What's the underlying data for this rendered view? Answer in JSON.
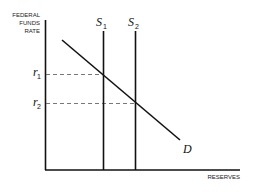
{
  "diagram": {
    "y_axis_label": [
      "FEDERAL",
      "FUNDS",
      "RATE"
    ],
    "x_axis_label": "RESERVES",
    "supply_1": {
      "symbol": "S",
      "subscript": "1"
    },
    "supply_2": {
      "symbol": "S",
      "subscript": "2"
    },
    "demand": {
      "symbol": "D"
    },
    "rate_1": {
      "symbol": "r",
      "subscript": "1"
    },
    "rate_2": {
      "symbol": "r",
      "subscript": "2"
    }
  }
}
